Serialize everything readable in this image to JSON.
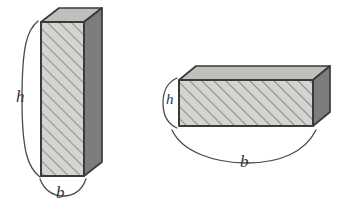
{
  "figure": {
    "background_color": "#ffffff",
    "stroke_color": "#3a3a3a",
    "colors": {
      "front_face": "#d0d0cc",
      "top_face": "#b8b8b4",
      "side_face": "#7d7d7d",
      "hatch_line": "#8e8e8a",
      "outline": "#3a3a3a",
      "brace": "#4a4a4a",
      "label_text": "#333333"
    },
    "hatching": {
      "pattern": "diagonal-lines",
      "direction": "lower-left-to-upper-right",
      "spacing_px": 6,
      "line_width_px": 1.4
    },
    "prisms": [
      {
        "name": "tall-prism",
        "orientation": "vertical",
        "front_face": {
          "x": 41,
          "y": 22,
          "width": 43,
          "height": 154
        },
        "depth_offset": {
          "dx": 18,
          "dy": -14
        },
        "labels": {
          "height": "h",
          "base": "b"
        }
      },
      {
        "name": "flat-prism",
        "orientation": "horizontal",
        "front_face": {
          "x": 179,
          "y": 80,
          "width": 134,
          "height": 46
        },
        "depth_offset": {
          "dx": 17,
          "dy": -14
        },
        "labels": {
          "height": "h",
          "base": "b"
        }
      }
    ],
    "labels": {
      "tall_height": "h",
      "tall_base": "b",
      "flat_height": "h",
      "flat_base": "b"
    }
  }
}
